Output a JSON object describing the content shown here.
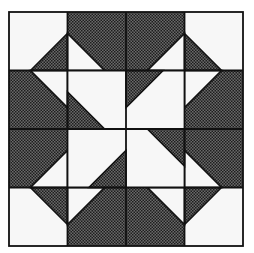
{
  "figure": {
    "title": "",
    "grid": {
      "rows": 4,
      "cols": 4
    },
    "colors": {
      "dark": "#4a4a4a",
      "light": "#f7f7f7",
      "line": "#111111",
      "background": "#ffffff"
    }
  }
}
